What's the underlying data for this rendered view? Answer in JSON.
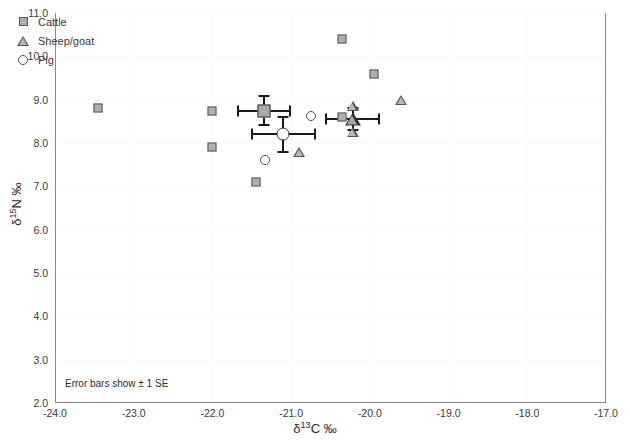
{
  "chart_data": {
    "type": "scatter",
    "title": "",
    "xlabel": "δ¹³C ‰",
    "ylabel": "δ¹⁵N ‰",
    "xlabel_parts": {
      "delta": "δ",
      "sup": "13",
      "rest": "C ‰"
    },
    "ylabel_parts": {
      "delta": "δ",
      "sup": "15",
      "rest": "N ‰"
    },
    "xlim": [
      -24.0,
      -17.0
    ],
    "ylim": [
      2.0,
      11.0
    ],
    "xticks": [
      "-24.0",
      "-23.0",
      "-22.0",
      "-21.0",
      "-20.0",
      "-19.0",
      "-18.0",
      "-17.0"
    ],
    "yticks": [
      "2.0",
      "3.0",
      "4.0",
      "5.0",
      "6.0",
      "7.0",
      "8.0",
      "9.0",
      "10.0",
      "11.0"
    ],
    "xtick_values": [
      -24.0,
      -23.0,
      -22.0,
      -21.0,
      -20.0,
      -19.0,
      -18.0,
      -17.0
    ],
    "ytick_values": [
      2.0,
      3.0,
      4.0,
      5.0,
      6.0,
      7.0,
      8.0,
      9.0,
      10.0,
      11.0
    ],
    "grid": true,
    "grid_color": "#fafafa",
    "legend_position": "top-left",
    "annotation": "Error bars show ± 1 SE",
    "series": [
      {
        "name": "Cattle",
        "marker": "square",
        "marker_fill": "#b0b0b0",
        "marker_edge": "#555555",
        "points": [
          {
            "x": -23.45,
            "y": 8.8
          },
          {
            "x": -22.0,
            "y": 7.9
          },
          {
            "x": -22.0,
            "y": 8.75
          },
          {
            "x": -21.45,
            "y": 7.1
          },
          {
            "x": -20.35,
            "y": 10.4
          },
          {
            "x": -20.35,
            "y": 8.6
          },
          {
            "x": -19.95,
            "y": 9.6
          }
        ],
        "mean": {
          "x": -21.35,
          "y": 8.75,
          "xerr": 0.33,
          "yerr": 0.33
        }
      },
      {
        "name": "Sheep/goat",
        "marker": "triangle",
        "marker_fill": "#b8b8b8",
        "marker_edge": "#555555",
        "points": [
          {
            "x": -20.9,
            "y": 7.8
          },
          {
            "x": -20.22,
            "y": 8.85
          },
          {
            "x": -20.22,
            "y": 8.25
          },
          {
            "x": -19.6,
            "y": 9.0
          }
        ],
        "mean": {
          "x": -20.22,
          "y": 8.55,
          "xerr": 0.34,
          "yerr": 0.26
        }
      },
      {
        "name": "Pig",
        "marker": "circle",
        "marker_fill": "#ffffff",
        "marker_edge": "#555555",
        "points": [
          {
            "x": -21.33,
            "y": 7.6
          },
          {
            "x": -20.75,
            "y": 8.62
          }
        ],
        "mean": {
          "x": -21.1,
          "y": 8.2,
          "xerr": 0.4,
          "yerr": 0.4
        }
      }
    ]
  },
  "legend": {
    "items": [
      {
        "label": "Cattle",
        "marker": "square"
      },
      {
        "label": "Sheep/goat",
        "marker": "triangle"
      },
      {
        "label": "Pig",
        "marker": "circle"
      }
    ]
  }
}
